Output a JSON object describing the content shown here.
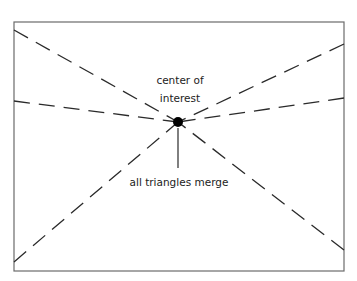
{
  "diagram": {
    "labels": {
      "center_line1": "center of",
      "center_line2": "interest",
      "merge": "all triangles merge"
    },
    "colors": {
      "frame": "#6b6b6b",
      "lines": "#2a2a2a",
      "dot": "#000000",
      "text": "#222222"
    },
    "frame": {
      "x": 14,
      "y": 22,
      "width": 330,
      "height": 249
    },
    "center_point": {
      "x": 178,
      "y": 122
    },
    "dashed_lines": [
      {
        "name": "top-left",
        "x": 14,
        "y": 30
      },
      {
        "name": "left-middle",
        "x": 14,
        "y": 101
      },
      {
        "name": "bottom-left",
        "x": 14,
        "y": 262
      },
      {
        "name": "top-right",
        "x": 344,
        "y": 44
      },
      {
        "name": "right-middle",
        "x": 344,
        "y": 98
      },
      {
        "name": "bottom-right",
        "x": 344,
        "y": 250
      }
    ]
  }
}
